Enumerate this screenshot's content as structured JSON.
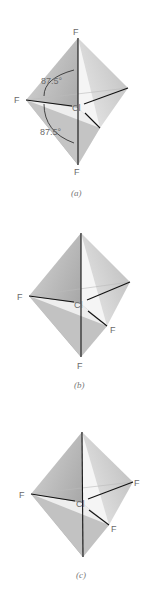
{
  "figure": {
    "panels": [
      {
        "caption": "(a)",
        "atoms": {
          "top": "F",
          "left": "F",
          "center": "Cl",
          "bottom": "F"
        },
        "angles": [
          "87.5°",
          "87.5°"
        ]
      },
      {
        "caption": "(b)",
        "atoms": {
          "left": "F",
          "center": "Cl",
          "front_right": "F",
          "bottom": "F"
        }
      },
      {
        "caption": "(c)",
        "atoms": {
          "left": "F",
          "center": "Cl",
          "right": "F",
          "front_right": "F"
        }
      }
    ]
  }
}
